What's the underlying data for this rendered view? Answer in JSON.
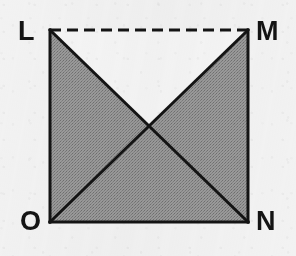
{
  "figure": {
    "kind": "geometry-diagram",
    "shape": "square-with-diagonals",
    "background_color": "#f2f2f2",
    "stroke_color": "#141414",
    "shaded_fill_color": "#8c8c8c",
    "unshaded_fill_color": "#f5f5f5",
    "stroke_width": 3,
    "canvas": {
      "width": 296,
      "height": 256
    },
    "square": {
      "left": 50,
      "top": 30,
      "right": 248,
      "bottom": 222,
      "width": 198,
      "height": 192
    },
    "center_point": {
      "x": 149,
      "y": 126
    }
  },
  "vertices": [
    {
      "id": "L",
      "label": "L",
      "position": "top-left",
      "x": 50,
      "y": 30
    },
    {
      "id": "M",
      "label": "M",
      "position": "top-right",
      "x": 248,
      "y": 30
    },
    {
      "id": "N",
      "label": "N",
      "position": "bottom-right",
      "x": 248,
      "y": 222
    },
    {
      "id": "O",
      "label": "O",
      "position": "bottom-left",
      "x": 50,
      "y": 222
    }
  ],
  "edges": [
    {
      "id": "LM",
      "from": "L",
      "to": "M",
      "style": "dashed",
      "dash_pattern": "11 6"
    },
    {
      "id": "MN",
      "from": "M",
      "to": "N",
      "style": "solid",
      "dash_pattern": ""
    },
    {
      "id": "ON",
      "from": "O",
      "to": "N",
      "style": "solid",
      "dash_pattern": ""
    },
    {
      "id": "LO",
      "from": "L",
      "to": "O",
      "style": "solid",
      "dash_pattern": ""
    }
  ],
  "diagonals": [
    {
      "id": "LN",
      "from": "L",
      "to": "N",
      "style": "solid"
    },
    {
      "id": "OM",
      "from": "O",
      "to": "M",
      "style": "solid"
    }
  ],
  "regions": [
    {
      "id": "top-triangle",
      "vertices": "L-M-center",
      "shaded": false,
      "points": "50,30 248,30 149,126"
    },
    {
      "id": "right-triangle",
      "vertices": "M-N-center",
      "shaded": true,
      "points": "248,30 248,222 149,126"
    },
    {
      "id": "bottom-triangle",
      "vertices": "O-N-center",
      "shaded": true,
      "points": "50,222 248,222 149,126"
    },
    {
      "id": "left-triangle",
      "vertices": "L-O-center",
      "shaded": true,
      "points": "50,30 50,222 149,126"
    }
  ]
}
